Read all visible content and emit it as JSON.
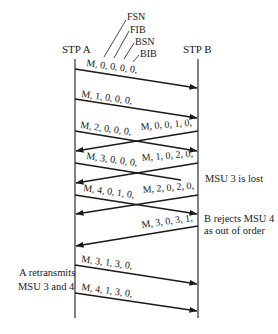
{
  "diagram": {
    "type": "sequence",
    "participants": [
      {
        "id": "A",
        "label": "STP A"
      },
      {
        "id": "B",
        "label": "STP B"
      }
    ],
    "field_labels": [
      "FSN",
      "FIB",
      "BSN",
      "BIB"
    ],
    "messages": [
      {
        "from": "A",
        "to": "B",
        "label": "M, 0, 0, 0, 0,"
      },
      {
        "from": "A",
        "to": "B",
        "label": "M, 1, 0, 0, 0,"
      },
      {
        "from": "A",
        "to": "B",
        "label": "M, 2, 0, 0, 0,"
      },
      {
        "from": "B",
        "to": "A",
        "label": "M, 0, 0, 1, 0,"
      },
      {
        "from": "A",
        "to": "B",
        "label": "M, 3, 0, 0, 0,",
        "lost": true
      },
      {
        "from": "B",
        "to": "A",
        "label": "M, 1, 0, 2, 0,"
      },
      {
        "from": "A",
        "to": "B",
        "label": "M, 4, 0, 1, 0,"
      },
      {
        "from": "B",
        "to": "A",
        "label": "M, 2, 0, 2, 0,"
      },
      {
        "from": "B",
        "to": "A",
        "label": "M, 3, 0, 3, 1,"
      },
      {
        "from": "A",
        "to": "B",
        "label": "M, 3, 1, 3, 0,"
      },
      {
        "from": "A",
        "to": "B",
        "label": "M, 4, 1, 3, 0,"
      }
    ],
    "notes": {
      "lost": "MSU 3 is lost",
      "reject_line1": "B rejects MSU 4",
      "reject_line2": "as out of order",
      "retransmit_line1": "A retransmits",
      "retransmit_line2": "MSU 3 and 4"
    }
  }
}
